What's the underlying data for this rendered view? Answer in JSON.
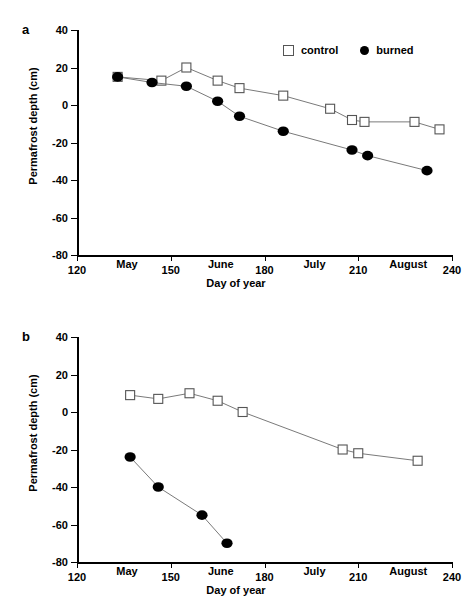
{
  "figure": {
    "panels": [
      {
        "id": "a",
        "letter": "a",
        "xlabel": "Day of year",
        "ylabel": "Permafrost depth (cm)"
      },
      {
        "id": "b",
        "letter": "b",
        "xlabel": "Day of year",
        "ylabel": "Permafrost depth (cm)"
      }
    ],
    "legend": {
      "control_label": "control",
      "burned_label": "burned",
      "control_symbol": "open-square",
      "burned_symbol": "filled-circle"
    },
    "axis": {
      "x_ticks": [
        120,
        150,
        180,
        210,
        240
      ],
      "x_tick_labels": [
        "120",
        "150",
        "180",
        "210",
        "240"
      ],
      "y_ticks": [
        40,
        20,
        0,
        -20,
        -40,
        -60,
        -80
      ],
      "y_tick_labels": [
        "40",
        "20",
        "0",
        "-20",
        "-40",
        "-60",
        "-80"
      ],
      "month_labels": [
        "May",
        "June",
        "July",
        "August"
      ],
      "month_positions": [
        136,
        166,
        196,
        226
      ]
    },
    "colors": {
      "axis": "#000000",
      "line": "#7a7a7a",
      "control_marker_edge": "#555555",
      "control_marker_fill": "#ffffff",
      "burned_marker_fill": "#000000"
    }
  },
  "chart_data": [
    {
      "type": "line",
      "panel": "a",
      "title": "",
      "xlabel": "Day of year",
      "ylabel": "Permafrost depth (cm)",
      "xlim": [
        120,
        240
      ],
      "ylim": [
        -80,
        40
      ],
      "grid": false,
      "legend_position": "top-right",
      "series": [
        {
          "name": "control",
          "marker": "open-square",
          "x": [
            133,
            147,
            155,
            165,
            172,
            186,
            201,
            208,
            212,
            228,
            236
          ],
          "y": [
            15,
            13,
            20,
            13,
            9,
            5,
            -2,
            -8,
            -9,
            -9,
            -13
          ]
        },
        {
          "name": "burned",
          "marker": "filled-circle",
          "x": [
            133,
            144,
            155,
            165,
            172,
            186,
            208,
            213,
            232
          ],
          "y": [
            15,
            12,
            10,
            2,
            -6,
            -14,
            -24,
            -27,
            -35
          ]
        }
      ]
    },
    {
      "type": "line",
      "panel": "b",
      "title": "",
      "xlabel": "Day of year",
      "ylabel": "Permafrost depth (cm)",
      "xlim": [
        120,
        240
      ],
      "ylim": [
        -80,
        40
      ],
      "grid": false,
      "legend_position": "top-right",
      "series": [
        {
          "name": "control",
          "marker": "open-square",
          "x": [
            137,
            146,
            156,
            165,
            173,
            205,
            210,
            229
          ],
          "y": [
            9,
            7,
            10,
            6,
            0,
            -20,
            -22,
            -26
          ]
        },
        {
          "name": "burned",
          "marker": "filled-circle",
          "x": [
            137,
            146,
            160,
            168
          ],
          "y": [
            -24,
            -40,
            -55,
            -70
          ]
        }
      ]
    }
  ]
}
